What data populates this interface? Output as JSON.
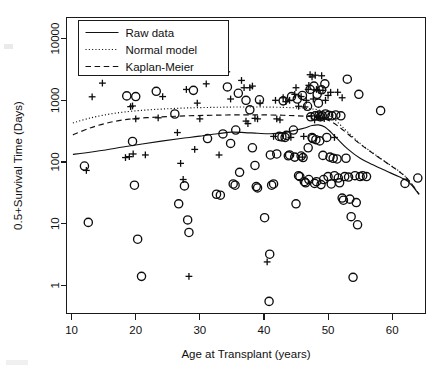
{
  "figure": {
    "background_color": "#ffffff",
    "ink_color": "#111111"
  },
  "chart_data": {
    "type": "scatter",
    "title": "",
    "xlabel": "Age at Transplant (years)",
    "ylabel": "0.5+Survival Time (Days)",
    "xlim": [
      9.2,
      65.2
    ],
    "ylim": [
      0.35,
      22000
    ],
    "yscale": "log",
    "xscale": "linear",
    "grid": false,
    "xticks": [
      10,
      20,
      30,
      40,
      50,
      60
    ],
    "xticklabels": [
      "10",
      "20",
      "30",
      "40",
      "50",
      "60"
    ],
    "yticks": [
      1,
      10,
      100,
      1000,
      10000
    ],
    "yticklabels": [
      "1",
      "10",
      "100",
      "1000",
      "10000"
    ],
    "legend": {
      "position": "upper left",
      "entries": [
        {
          "label": "Raw data",
          "style": "solid"
        },
        {
          "label": "Normal model",
          "style": "dotted"
        },
        {
          "label": "Kaplan-Meier",
          "style": "dashed"
        }
      ]
    },
    "markers": {
      "circle_meaning": "death (uncensored)",
      "plus_meaning": "censored observation"
    },
    "series": [
      {
        "name": "Deaths (circles)",
        "marker": "circle",
        "points": [
          [
            12.0,
            86
          ],
          [
            12.6,
            10.5
          ],
          [
            18.6,
            1180
          ],
          [
            19.5,
            215
          ],
          [
            19.8,
            42
          ],
          [
            20.0,
            1150
          ],
          [
            20.3,
            5.6
          ],
          [
            20.9,
            1.4
          ],
          [
            23.2,
            1400
          ],
          [
            26.1,
            600
          ],
          [
            26.7,
            21
          ],
          [
            27.6,
            41
          ],
          [
            28.1,
            11.5
          ],
          [
            28.3,
            7.2
          ],
          [
            29.0,
            1450
          ],
          [
            31.2,
            240
          ],
          [
            32.6,
            30
          ],
          [
            33.2,
            29
          ],
          [
            33.6,
            285
          ],
          [
            34.3,
            1650
          ],
          [
            34.8,
            200
          ],
          [
            35.2,
            44
          ],
          [
            35.5,
            42
          ],
          [
            35.6,
            330
          ],
          [
            36.0,
            1300
          ],
          [
            36.2,
            68
          ],
          [
            37.2,
            1000
          ],
          [
            37.8,
            700
          ],
          [
            38.2,
            170
          ],
          [
            38.6,
            88
          ],
          [
            38.8,
            40
          ],
          [
            39.0,
            38
          ],
          [
            39.3,
            1020
          ],
          [
            40.1,
            12.5
          ],
          [
            40.8,
            0.55
          ],
          [
            40.9,
            3.2
          ],
          [
            41.0,
            130
          ],
          [
            41.2,
            42
          ],
          [
            41.5,
            44
          ],
          [
            42.0,
            135
          ],
          [
            42.4,
            260
          ],
          [
            42.8,
            255
          ],
          [
            43.0,
            980
          ],
          [
            43.3,
            250
          ],
          [
            43.5,
            270
          ],
          [
            44.0,
            130
          ],
          [
            44.3,
            1150
          ],
          [
            44.6,
            330
          ],
          [
            44.8,
            120
          ],
          [
            45.0,
            21
          ],
          [
            45.2,
            1050
          ],
          [
            45.4,
            60
          ],
          [
            45.6,
            58
          ],
          [
            45.8,
            125
          ],
          [
            46.0,
            1200
          ],
          [
            46.1,
            118
          ],
          [
            46.3,
            48
          ],
          [
            46.5,
            46
          ],
          [
            46.8,
            800
          ],
          [
            46.9,
            170
          ],
          [
            47.0,
            52
          ],
          [
            47.2,
            1500
          ],
          [
            47.3,
            540
          ],
          [
            47.5,
            250
          ],
          [
            47.6,
            240
          ],
          [
            47.8,
            1700
          ],
          [
            48.0,
            560
          ],
          [
            48.1,
            230
          ],
          [
            48.2,
            48
          ],
          [
            48.3,
            1250
          ],
          [
            48.5,
            900
          ],
          [
            48.6,
            575
          ],
          [
            48.7,
            220
          ],
          [
            48.8,
            540
          ],
          [
            49.0,
            1480
          ],
          [
            49.1,
            560
          ],
          [
            49.2,
            128
          ],
          [
            49.3,
            52
          ],
          [
            49.5,
            1850
          ],
          [
            49.6,
            600
          ],
          [
            49.8,
            250
          ],
          [
            50.0,
            58
          ],
          [
            50.1,
            570
          ],
          [
            50.3,
            120
          ],
          [
            50.5,
            44
          ],
          [
            50.6,
            560
          ],
          [
            50.8,
            115
          ],
          [
            51.0,
            60
          ],
          [
            51.2,
            580
          ],
          [
            51.4,
            112
          ],
          [
            51.6,
            55
          ],
          [
            51.8,
            46
          ],
          [
            52.0,
            560
          ],
          [
            52.2,
            26
          ],
          [
            52.4,
            24
          ],
          [
            52.6,
            58
          ],
          [
            53.0,
            2200
          ],
          [
            53.2,
            57
          ],
          [
            53.4,
            25
          ],
          [
            53.6,
            13
          ],
          [
            53.9,
            1.35
          ],
          [
            54.2,
            60
          ],
          [
            54.4,
            22
          ],
          [
            54.6,
            9.6
          ],
          [
            54.8,
            1250
          ],
          [
            55.0,
            58
          ],
          [
            55.4,
            60
          ],
          [
            56.0,
            58
          ],
          [
            58.2,
            680
          ],
          [
            62.0,
            45
          ],
          [
            64.0,
            55
          ],
          [
            52.8,
            115
          ],
          [
            43.8,
            126
          ],
          [
            47.9,
            45
          ],
          [
            48.9,
            43
          ]
        ]
      },
      {
        "name": "Censored (plus signs)",
        "marker": "plus",
        "points": [
          [
            12.3,
            73
          ],
          [
            13.2,
            1140
          ],
          [
            14.8,
            1900
          ],
          [
            18.4,
            118
          ],
          [
            19.0,
            122
          ],
          [
            19.6,
            135
          ],
          [
            19.2,
            790
          ],
          [
            19.5,
            810
          ],
          [
            20.0,
            500
          ],
          [
            21.5,
            130
          ],
          [
            23.5,
            520
          ],
          [
            24.2,
            1150
          ],
          [
            26.5,
            300
          ],
          [
            27.0,
            95
          ],
          [
            27.4,
            52
          ],
          [
            27.9,
            1500
          ],
          [
            28.3,
            1.4
          ],
          [
            29.2,
            160
          ],
          [
            29.6,
            900
          ],
          [
            30.0,
            500
          ],
          [
            31.0,
            1850
          ],
          [
            33.0,
            130
          ],
          [
            34.2,
            2900
          ],
          [
            34.8,
            1050
          ],
          [
            36.5,
            2100
          ],
          [
            36.9,
            1600
          ],
          [
            37.2,
            460
          ],
          [
            37.5,
            420
          ],
          [
            37.8,
            1600
          ],
          [
            38.2,
            1700
          ],
          [
            38.6,
            510
          ],
          [
            39.0,
            500
          ],
          [
            39.4,
            900
          ],
          [
            40.5,
            2.4
          ],
          [
            41.5,
            260
          ],
          [
            42.0,
            500
          ],
          [
            42.5,
            480
          ],
          [
            43.0,
            1100
          ],
          [
            43.4,
            950
          ],
          [
            44.0,
            1000
          ],
          [
            44.8,
            1250
          ],
          [
            45.0,
            1600
          ],
          [
            45.4,
            800
          ],
          [
            45.8,
            1150
          ],
          [
            46.0,
            120
          ],
          [
            46.4,
            780
          ],
          [
            46.6,
            1000
          ],
          [
            46.9,
            1500
          ],
          [
            47.0,
            1750
          ],
          [
            47.2,
            2600
          ],
          [
            47.4,
            560
          ],
          [
            47.5,
            2400
          ],
          [
            47.7,
            1050
          ],
          [
            47.9,
            480
          ],
          [
            48.0,
            2550
          ],
          [
            48.2,
            1500
          ],
          [
            48.4,
            550
          ],
          [
            48.6,
            1450
          ],
          [
            48.8,
            520
          ],
          [
            49.0,
            2500
          ],
          [
            49.2,
            1450
          ],
          [
            49.4,
            505
          ],
          [
            49.6,
            1000
          ],
          [
            50.0,
            1200
          ],
          [
            50.4,
            1350
          ],
          [
            51.5,
            1350
          ],
          [
            52.2,
            1100
          ],
          [
            51.0,
            250
          ],
          [
            46.2,
            260
          ],
          [
            44.2,
            250
          ],
          [
            41.8,
            1000
          ]
        ]
      }
    ],
    "curves": [
      {
        "name": "Raw data",
        "style": "solid",
        "points": [
          [
            10.2,
            133
          ],
          [
            12,
            140
          ],
          [
            15,
            155
          ],
          [
            18,
            175
          ],
          [
            21,
            196
          ],
          [
            24,
            218
          ],
          [
            27,
            240
          ],
          [
            30,
            262
          ],
          [
            33,
            290
          ],
          [
            35,
            305
          ],
          [
            37,
            300
          ],
          [
            39,
            292
          ],
          [
            41,
            287
          ],
          [
            43,
            300
          ],
          [
            45,
            330
          ],
          [
            46.5,
            360
          ],
          [
            47.5,
            390
          ],
          [
            48.5,
            400
          ],
          [
            49.5,
            370
          ],
          [
            50.5,
            300
          ],
          [
            51.5,
            235
          ],
          [
            53,
            165
          ],
          [
            55,
            115
          ],
          [
            57,
            90
          ],
          [
            59,
            72
          ],
          [
            61,
            58
          ],
          [
            62.5,
            48
          ],
          [
            64.2,
            30
          ]
        ]
      },
      {
        "name": "Normal model",
        "style": "dotted",
        "points": [
          [
            10.2,
            430
          ],
          [
            13,
            520
          ],
          [
            16,
            600
          ],
          [
            19,
            660
          ],
          [
            22,
            700
          ],
          [
            25,
            730
          ],
          [
            28,
            752
          ],
          [
            31,
            765
          ],
          [
            34,
            775
          ],
          [
            37,
            780
          ],
          [
            40,
            778
          ],
          [
            43,
            768
          ],
          [
            45,
            755
          ],
          [
            46.5,
            740
          ],
          [
            47.5,
            725
          ],
          [
            48.5,
            700
          ],
          [
            49.5,
            640
          ],
          [
            50.5,
            545
          ],
          [
            51.5,
            440
          ],
          [
            53,
            310
          ],
          [
            55,
            200
          ],
          [
            57,
            140
          ],
          [
            59,
            100
          ],
          [
            61,
            72
          ],
          [
            62.5,
            52
          ],
          [
            64.2,
            30
          ]
        ]
      },
      {
        "name": "Kaplan-Meier",
        "style": "dashed",
        "points": [
          [
            10.2,
            275
          ],
          [
            13,
            360
          ],
          [
            16,
            440
          ],
          [
            19,
            495
          ],
          [
            22,
            525
          ],
          [
            25,
            545
          ],
          [
            28,
            560
          ],
          [
            31,
            570
          ],
          [
            34,
            578
          ],
          [
            37,
            582
          ],
          [
            40,
            580
          ],
          [
            43,
            572
          ],
          [
            45,
            562
          ],
          [
            46.5,
            552
          ],
          [
            47.5,
            545
          ],
          [
            48.5,
            530
          ],
          [
            49.5,
            500
          ],
          [
            50.5,
            450
          ],
          [
            51.5,
            385
          ],
          [
            53,
            290
          ],
          [
            55,
            195
          ],
          [
            57,
            138
          ],
          [
            59,
            99
          ],
          [
            61,
            71
          ],
          [
            62.5,
            52
          ],
          [
            64.2,
            30
          ]
        ]
      }
    ]
  }
}
